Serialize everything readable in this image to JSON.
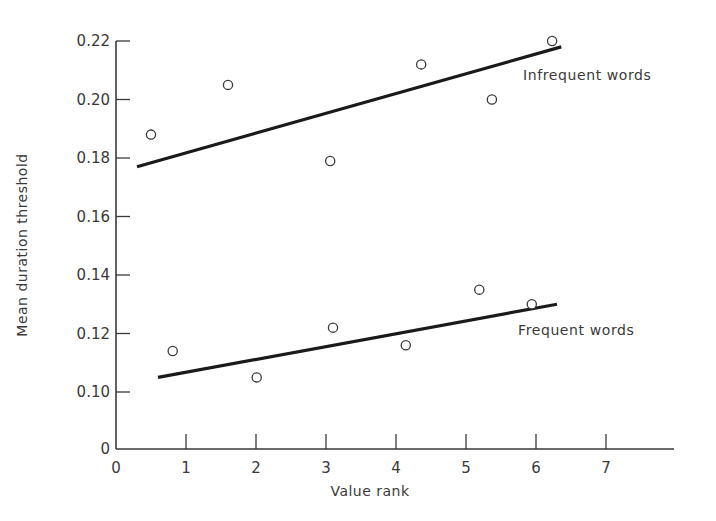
{
  "chart_data": {
    "type": "scatter",
    "title": "",
    "xlabel": "Value rank",
    "ylabel": "Mean duration threshold",
    "xlim": [
      0,
      7.9
    ],
    "ylim": [
      0.1,
      0.22
    ],
    "y_axis_break_label": "0",
    "x_ticks": [
      0,
      1,
      2,
      3,
      4,
      5,
      6,
      7
    ],
    "x_tick_labels": [
      "0",
      "1",
      "2",
      "3",
      "4",
      "5",
      "6",
      "7"
    ],
    "y_ticks": [
      0.1,
      0.12,
      0.14,
      0.16,
      0.18,
      0.2,
      0.22
    ],
    "y_tick_labels": [
      "0.10",
      "0.12",
      "0.14",
      "0.16",
      "0.18",
      "0.20",
      "0.22"
    ],
    "grid": false,
    "legend": "inline labels next to fitted lines",
    "series": [
      {
        "name": "Infrequent words",
        "marker": "open-circle",
        "x": [
          0.5,
          1.6,
          3.06,
          4.36,
          5.37,
          6.23
        ],
        "y": [
          0.188,
          0.205,
          0.179,
          0.212,
          0.2,
          0.22
        ],
        "fit_line": {
          "x": [
            0.3,
            6.36
          ],
          "y": [
            0.177,
            0.218
          ]
        }
      },
      {
        "name": "Frequent words",
        "marker": "open-circle",
        "x": [
          0.81,
          2.01,
          3.1,
          4.14,
          5.19,
          5.94
        ],
        "y": [
          0.114,
          0.105,
          0.122,
          0.116,
          0.135,
          0.13
        ],
        "fit_line": {
          "x": [
            0.6,
            6.3
          ],
          "y": [
            0.105,
            0.13
          ]
        }
      }
    ],
    "colors": {
      "axis": "#3a3a3a",
      "line": "#1a1a1a",
      "marker": "#3a3a3a",
      "background": "#ffffff"
    }
  }
}
